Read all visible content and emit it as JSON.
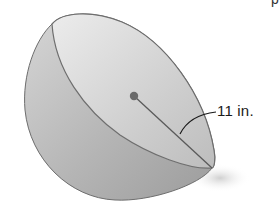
{
  "figure": {
    "type": "hemisphere",
    "radius_label": "11 in.",
    "colors": {
      "surface_light": "#e4e4e4",
      "surface_dark": "#a9a9a9",
      "outline": "#6e6e6e",
      "center_dot": "#6a6a6a",
      "shadow": "#d8d8d8"
    }
  },
  "top_text_fragment": "p"
}
